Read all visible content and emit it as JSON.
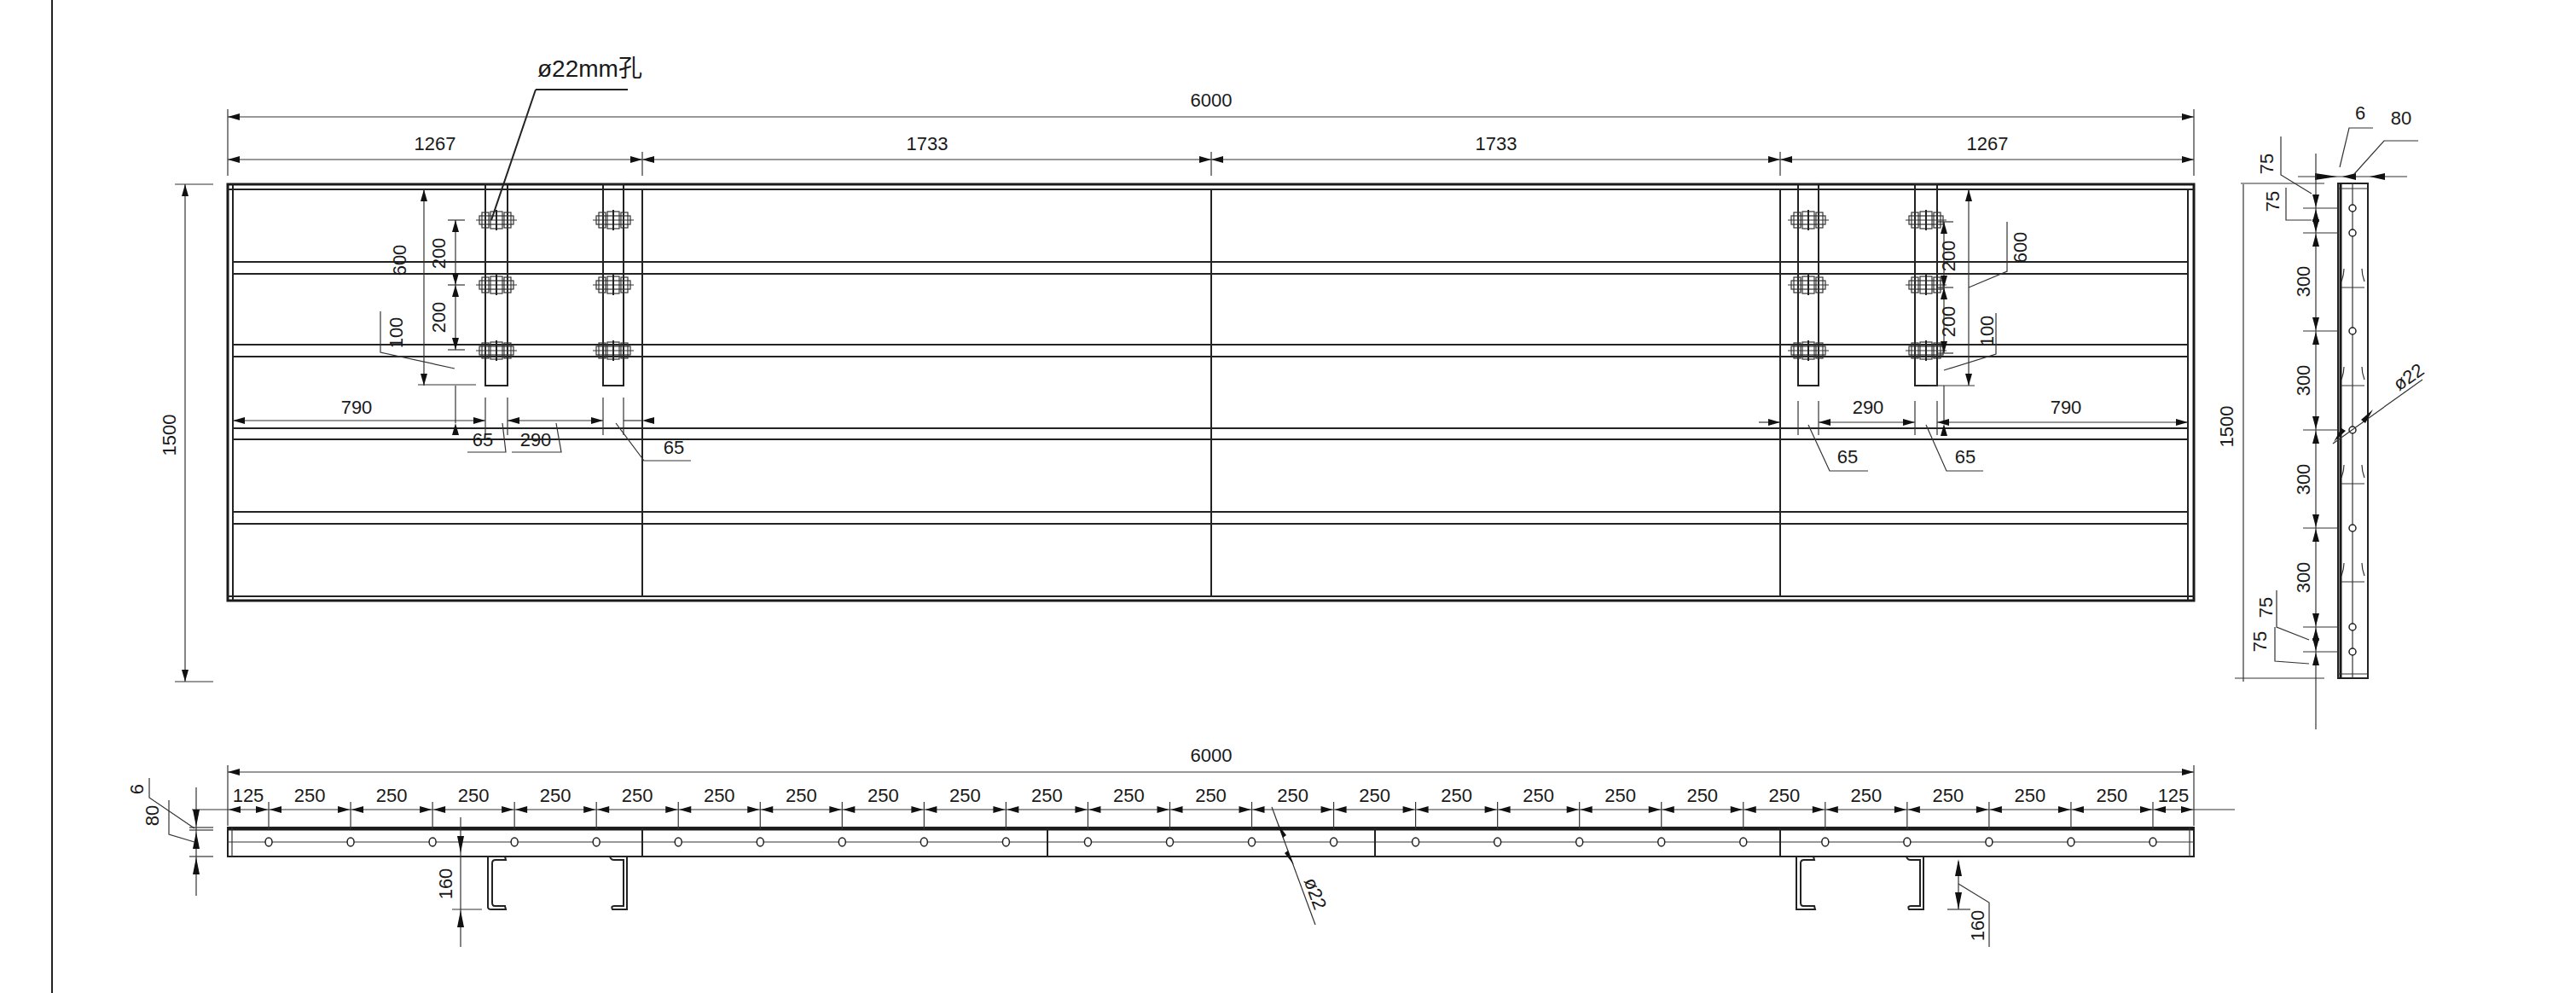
{
  "drawing": {
    "units": "mm",
    "hole_callout": "ø22mm孔",
    "plan_view": {
      "overall_width": "6000",
      "overall_height": "1500",
      "segments": [
        "1267",
        "1733",
        "1733",
        "1267"
      ],
      "bolt_pitch_top": "200",
      "bolt_pitch_bottom": "200",
      "strip_span": "600",
      "strip_offset": "100",
      "left_offset": "790",
      "right_offset": "790",
      "strip_width_left": "65",
      "strip_gap_left": "290",
      "strip_width_left_2": "65",
      "strip_width_right": "65",
      "strip_gap_right": "290",
      "strip_width_right_2": "65"
    },
    "side_view": {
      "thickness": "6",
      "depth": "80",
      "height": "1500",
      "spacing_top": [
        "75",
        "75"
      ],
      "spacing_mid": [
        "300",
        "300",
        "300",
        "300"
      ],
      "spacing_bottom": [
        "75",
        "75"
      ],
      "hole_dia": "ø22"
    },
    "elevation_view": {
      "overall_width": "6000",
      "thickness": "6",
      "depth": "80",
      "hole_spacing": [
        "125",
        "250",
        "250",
        "250",
        "250",
        "250",
        "250",
        "250",
        "250",
        "250",
        "250",
        "250",
        "250",
        "250",
        "250",
        "250",
        "250",
        "250",
        "250",
        "250",
        "250",
        "250",
        "250",
        "250",
        "125"
      ],
      "hole_dia": "ø22",
      "channel_depth_left": "160",
      "channel_depth_right": "160"
    }
  }
}
